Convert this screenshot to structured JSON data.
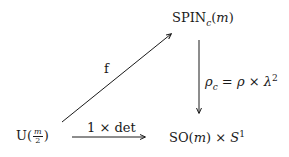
{
  "diagram": {
    "type": "commutative-diagram",
    "nodes": {
      "spin": {
        "main": "SPIN",
        "subscript": "c",
        "open": "(",
        "arg": "m",
        "close": ")"
      },
      "unitary": {
        "main": "U",
        "open": "(",
        "frac_num": "m",
        "frac_den": "2",
        "close": ")"
      },
      "so": {
        "main": "SO",
        "open": "(",
        "arg": "m",
        "close": ")",
        "times": " × ",
        "sphere": "S",
        "sphere_sup": "1"
      }
    },
    "arrows": {
      "f": {
        "label": "f",
        "from": "unitary",
        "to": "spin"
      },
      "rho_c": {
        "from": "spin",
        "to": "so",
        "label_rho": "ρ",
        "label_sub": "c",
        "label_eq": " = ",
        "label_rho2": "ρ",
        "label_times": " × ",
        "label_lambda": "λ",
        "label_sup": "2"
      },
      "one_det": {
        "from": "unitary",
        "to": "so",
        "label": "1 × det"
      }
    },
    "colors": {
      "ink": "#1a1a1a",
      "background": "#ffffff"
    }
  }
}
